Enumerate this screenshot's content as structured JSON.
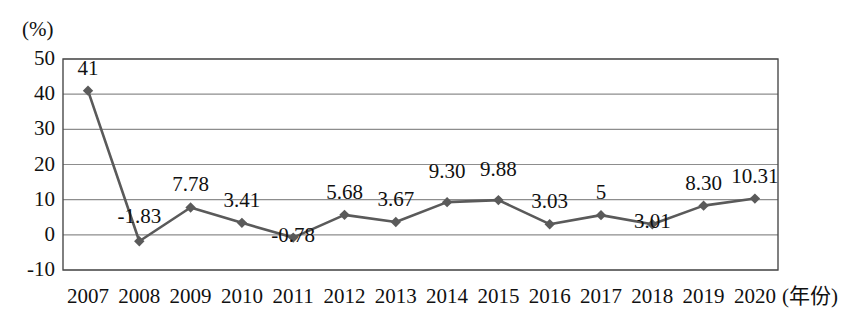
{
  "chart_data": {
    "type": "line",
    "title": "",
    "xlabel": "(年份)",
    "ylabel": "(%)",
    "ylim": [
      -10,
      50
    ],
    "yticks": [
      "50",
      "40",
      "30",
      "20",
      "10",
      "0",
      "-10"
    ],
    "grid": true,
    "legend": "none",
    "series_color": "#5a5a5a",
    "marker": "diamond",
    "categories": [
      "2007",
      "2008",
      "2009",
      "2010",
      "2011",
      "2012",
      "2013",
      "2014",
      "2015",
      "2016",
      "2017",
      "2018",
      "2019",
      "2020"
    ],
    "values": [
      41,
      -1.83,
      7.78,
      3.41,
      -0.78,
      5.68,
      3.67,
      9.3,
      9.88,
      3.03,
      5.6,
      3.01,
      8.3,
      10.31
    ],
    "data_labels": [
      "41",
      "-1.83",
      "7.78",
      "3.41",
      "-0.78",
      "5.68",
      "3.67",
      "9.30",
      "9.88",
      "3.03",
      "5",
      "3.01",
      "8.30",
      "10.31"
    ],
    "label_offsets_px": [
      -22,
      -24,
      -22,
      -22,
      -2,
      -22,
      -22,
      -30,
      -30,
      -22,
      -22,
      -2,
      -22,
      -22
    ]
  }
}
